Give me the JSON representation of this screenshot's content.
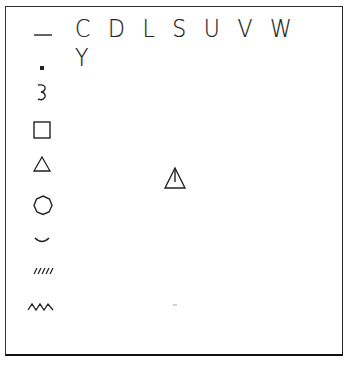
{
  "figure": {
    "header_letters": "C D L S U V W Y",
    "symbols": [
      {
        "name": "underscore-dash"
      },
      {
        "name": "small-filled-square"
      },
      {
        "name": "three-curve"
      },
      {
        "name": "open-square"
      },
      {
        "name": "open-triangle"
      },
      {
        "name": "open-heptagon"
      },
      {
        "name": "smile-arc"
      },
      {
        "name": "hatched-slashes"
      },
      {
        "name": "zigzag-wave"
      }
    ],
    "center_symbol": {
      "name": "triangle-with-vertical-line"
    },
    "colors": {
      "ink": "#222222",
      "background": "#ffffff"
    }
  }
}
